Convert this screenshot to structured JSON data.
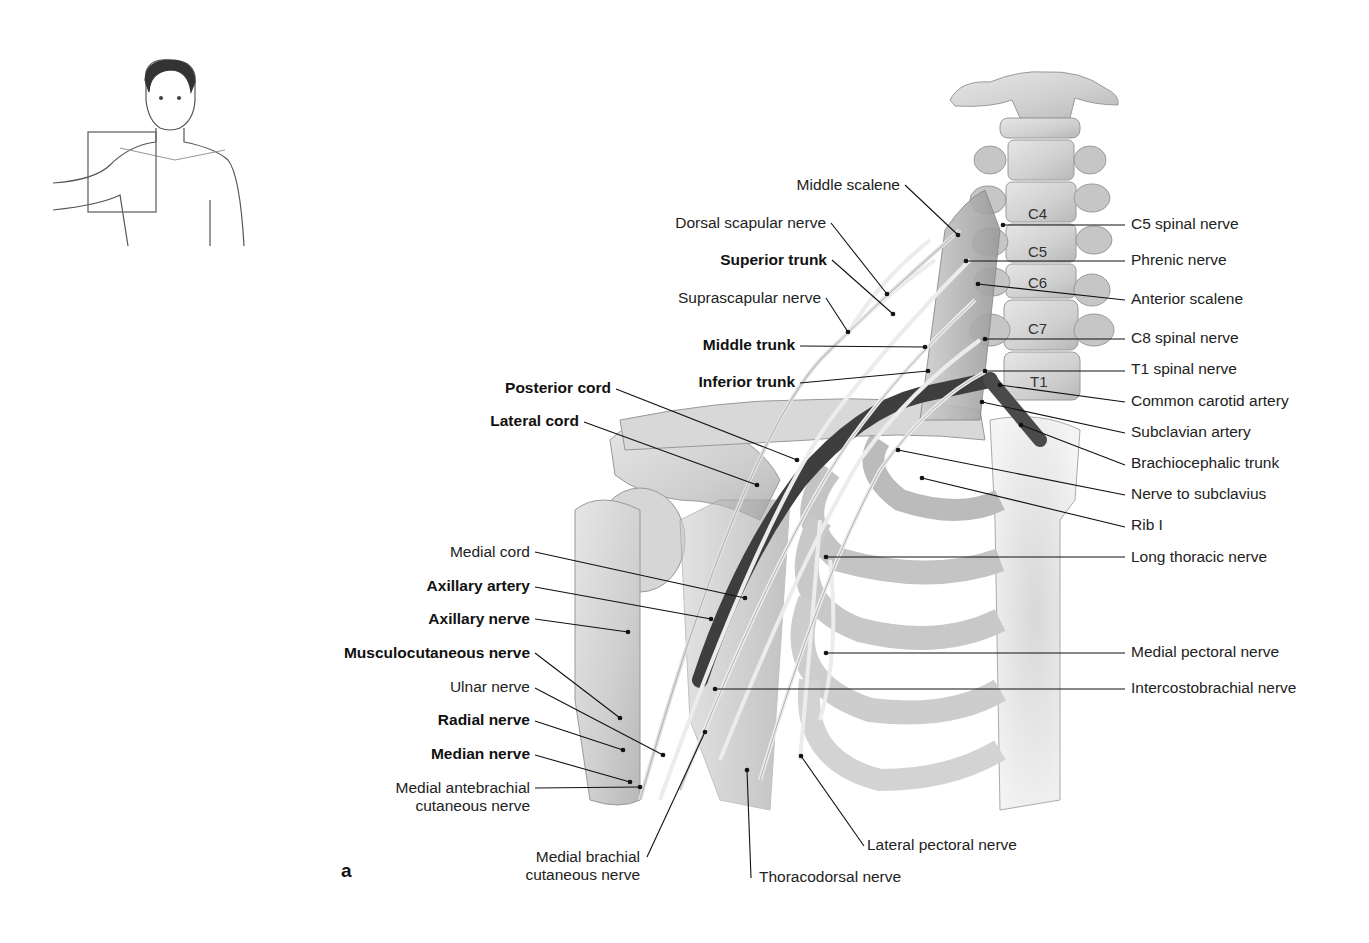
{
  "figure": {
    "panel_letter": "a",
    "orientation_inset": {
      "description": "Male torso outline with box over right shoulder"
    },
    "vertebra_labels": [
      {
        "text": "C4",
        "x": 1028,
        "y": 205
      },
      {
        "text": "C5",
        "x": 1028,
        "y": 243
      },
      {
        "text": "C6",
        "x": 1028,
        "y": 274
      },
      {
        "text": "C7",
        "x": 1028,
        "y": 320
      },
      {
        "text": "T1",
        "x": 1030,
        "y": 373
      }
    ],
    "labels_left": [
      {
        "text": "Middle scalene",
        "bold": false,
        "x": 900,
        "y": 176,
        "ax": 958,
        "ay": 235,
        "lx": 905,
        "ly": 185
      },
      {
        "text": "Dorsal scapular nerve",
        "bold": false,
        "x": 826,
        "y": 214,
        "ax": 887,
        "ay": 294,
        "lx": 831,
        "ly": 223
      },
      {
        "text": "Superior trunk",
        "bold": true,
        "x": 827,
        "y": 251,
        "ax": 893,
        "ay": 314,
        "lx": 832,
        "ly": 260
      },
      {
        "text": "Suprascapular nerve",
        "bold": false,
        "x": 821,
        "y": 289,
        "ax": 848,
        "ay": 332,
        "lx": 826,
        "ly": 298
      },
      {
        "text": "Middle trunk",
        "bold": true,
        "x": 795,
        "y": 336,
        "ax": 925,
        "ay": 347,
        "lx": 800,
        "ly": 346
      },
      {
        "text": "Inferior trunk",
        "bold": true,
        "x": 795,
        "y": 373,
        "ax": 928,
        "ay": 371,
        "lx": 800,
        "ly": 383
      },
      {
        "text": "Posterior cord",
        "bold": true,
        "x": 611,
        "y": 379,
        "ax": 797,
        "ay": 460,
        "lx": 616,
        "ly": 389
      },
      {
        "text": "Lateral cord",
        "bold": true,
        "x": 579,
        "y": 412,
        "ax": 757,
        "ay": 485,
        "lx": 584,
        "ly": 422
      },
      {
        "text": "Medial cord",
        "bold": false,
        "x": 530,
        "y": 543,
        "ax": 745,
        "ay": 598,
        "lx": 535,
        "ly": 552
      },
      {
        "text": "Axillary artery",
        "bold": true,
        "x": 530,
        "y": 577,
        "ax": 711,
        "ay": 619,
        "lx": 535,
        "ly": 587
      },
      {
        "text": "Axillary nerve",
        "bold": true,
        "x": 530,
        "y": 610,
        "ax": 628,
        "ay": 632,
        "lx": 535,
        "ly": 619
      },
      {
        "text": "Musculocutaneous nerve",
        "bold": true,
        "x": 530,
        "y": 644,
        "ax": 620,
        "ay": 718,
        "lx": 535,
        "ly": 653
      },
      {
        "text": "Ulnar nerve",
        "bold": false,
        "x": 530,
        "y": 678,
        "ax": 663,
        "ay": 755,
        "lx": 535,
        "ly": 688
      },
      {
        "text": "Radial nerve",
        "bold": true,
        "x": 530,
        "y": 711,
        "ax": 623,
        "ay": 750,
        "lx": 535,
        "ly": 721
      },
      {
        "text": "Median nerve",
        "bold": true,
        "x": 530,
        "y": 745,
        "ax": 630,
        "ay": 782,
        "lx": 535,
        "ly": 755
      },
      {
        "text": "Medial antebrachial\ncutaneous nerve",
        "bold": false,
        "x": 530,
        "y": 779,
        "ax": 640,
        "ay": 787,
        "lx": 535,
        "ly": 788
      },
      {
        "text": "Medial brachial\ncutaneous nerve",
        "bold": false,
        "x": 640,
        "y": 848,
        "ax": 705,
        "ay": 732,
        "lx": 647,
        "ly": 857
      }
    ],
    "labels_right": [
      {
        "text": "C5 spinal nerve",
        "x": 1131,
        "y": 215,
        "ax": 1003,
        "ay": 225,
        "lx": 1125,
        "ly": 225
      },
      {
        "text": "Phrenic nerve",
        "x": 1131,
        "y": 251,
        "ax": 966,
        "ay": 261,
        "lx": 1125,
        "ly": 261
      },
      {
        "text": "Anterior scalene",
        "x": 1131,
        "y": 290,
        "ax": 978,
        "ay": 284,
        "lx": 1125,
        "ly": 300
      },
      {
        "text": "C8 spinal nerve",
        "x": 1131,
        "y": 329,
        "ax": 985,
        "ay": 339,
        "lx": 1125,
        "ly": 339
      },
      {
        "text": "T1 spinal nerve",
        "x": 1131,
        "y": 360,
        "ax": 985,
        "ay": 371,
        "lx": 1125,
        "ly": 371
      },
      {
        "text": "Common carotid artery",
        "x": 1131,
        "y": 392,
        "ax": 1000,
        "ay": 385,
        "lx": 1125,
        "ly": 402
      },
      {
        "text": "Subclavian artery",
        "x": 1131,
        "y": 423,
        "ax": 982,
        "ay": 402,
        "lx": 1125,
        "ly": 433
      },
      {
        "text": "Brachiocephalic trunk",
        "x": 1131,
        "y": 454,
        "ax": 1021,
        "ay": 425,
        "lx": 1125,
        "ly": 465
      },
      {
        "text": "Nerve to subclavius",
        "x": 1131,
        "y": 485,
        "ax": 898,
        "ay": 450,
        "lx": 1125,
        "ly": 495
      },
      {
        "text": "Rib I",
        "x": 1131,
        "y": 516,
        "ax": 922,
        "ay": 478,
        "lx": 1125,
        "ly": 527
      },
      {
        "text": "Long thoracic nerve",
        "x": 1131,
        "y": 548,
        "ax": 826,
        "ay": 557,
        "lx": 1125,
        "ly": 557
      },
      {
        "text": "Medial pectoral nerve",
        "x": 1131,
        "y": 643,
        "ax": 826,
        "ay": 653,
        "lx": 1125,
        "ly": 653
      },
      {
        "text": "Intercostobrachial nerve",
        "x": 1131,
        "y": 679,
        "ax": 715,
        "ay": 689,
        "lx": 1125,
        "ly": 689
      },
      {
        "text": "Lateral pectoral nerve",
        "x": 867,
        "y": 836,
        "ax": 801,
        "ay": 756,
        "lx": 864,
        "ly": 846
      },
      {
        "text": "Thoracodorsal nerve",
        "x": 759,
        "y": 868,
        "ax": 747,
        "ay": 770,
        "lx": 751,
        "ly": 878
      }
    ]
  }
}
